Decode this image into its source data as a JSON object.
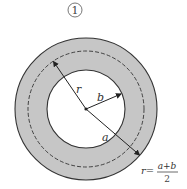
{
  "diagram": {
    "figure_label": "①",
    "labels": {
      "r": "r",
      "b": "b",
      "a": "a"
    },
    "formula": {
      "lhs": "r=",
      "numerator": "a+b",
      "denominator": "2"
    },
    "colors": {
      "ring_fill": "#c6c6c6",
      "stroke": "#333333",
      "background": "#ffffff"
    },
    "geometry": {
      "center": [
        86,
        109
      ],
      "outer_radius": 71,
      "mean_radius_dashed": 58,
      "inner_radius": 39
    }
  }
}
